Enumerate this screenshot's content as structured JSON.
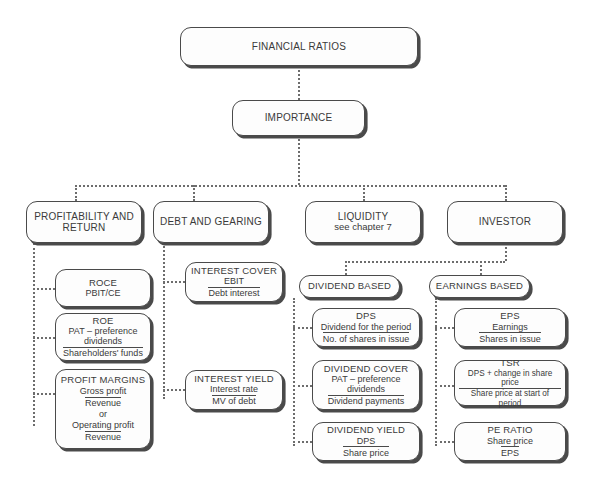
{
  "diagram": {
    "title": "FINANCIAL RATIOS",
    "root": {
      "label": "FINANCIAL RATIOS"
    },
    "importance": {
      "label": "IMPORTANCE"
    },
    "categories": [
      {
        "label": "PROFITABILITY AND RETURN"
      },
      {
        "label": "DEBT AND GEARING"
      },
      {
        "label": "LIQUIDITY",
        "note": "see chapter 7"
      },
      {
        "label": "INVESTOR"
      }
    ],
    "profitability_items": [
      {
        "title": "ROCE",
        "sub": "PBIT/CE"
      },
      {
        "title": "ROE",
        "numerator": "PAT – preference dividends",
        "denominator": "Shareholders' funds"
      },
      {
        "title": "PROFIT MARGINS",
        "numerator1": "Gross profit",
        "denominator1": "Revenue",
        "connector": "or",
        "numerator2": "Operating profit",
        "denominator2": "Revenue"
      }
    ],
    "debt_items": [
      {
        "title": "INTEREST COVER",
        "numerator": "EBIT",
        "denominator": "Debt interest"
      },
      {
        "title": "INTEREST YIELD",
        "numerator": "Interest rate",
        "denominator": "MV of debt"
      }
    ],
    "investor_groups": [
      {
        "label": "DIVIDEND BASED"
      },
      {
        "label": "EARNINGS BASED"
      }
    ],
    "dividend_items": [
      {
        "title": "DPS",
        "numerator": "Dividend for the period",
        "denominator": "No. of shares in issue"
      },
      {
        "title": "DIVIDEND COVER",
        "numerator": "PAT – preference dividends",
        "denominator": "Dividend payments"
      },
      {
        "title": "DIVIDEND YIELD",
        "numerator": "DPS",
        "denominator": "Share price"
      }
    ],
    "earnings_items": [
      {
        "title": "EPS",
        "numerator": "Earnings",
        "denominator": "Shares in issue"
      },
      {
        "title": "TSR",
        "numerator": "DPS + change in share price",
        "denominator": "Share price at start of period"
      },
      {
        "title": "PE RATIO",
        "numerator": "Share price",
        "denominator": "EPS"
      }
    ],
    "colors": {
      "box_border": "#4a4a4a",
      "box_fill": "#fdfdfd",
      "connector": "#6d6d6d",
      "text": "#3a3a3a",
      "background": "#ffffff"
    }
  }
}
